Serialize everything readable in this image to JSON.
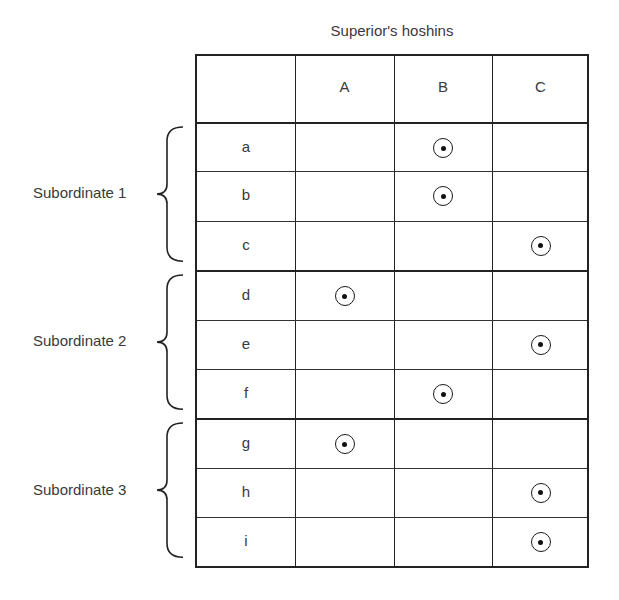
{
  "title": "Superior's hoshins",
  "columns": [
    "A",
    "B",
    "C"
  ],
  "groups": [
    {
      "label": "Subordinate 1",
      "rows": [
        {
          "id": "a",
          "mark": "B"
        },
        {
          "id": "b",
          "mark": "B"
        },
        {
          "id": "c",
          "mark": "C"
        }
      ]
    },
    {
      "label": "Subordinate 2",
      "rows": [
        {
          "id": "d",
          "mark": "A"
        },
        {
          "id": "e",
          "mark": "C"
        },
        {
          "id": "f",
          "mark": "B"
        }
      ]
    },
    {
      "label": "Subordinate 3",
      "rows": [
        {
          "id": "g",
          "mark": "A"
        },
        {
          "id": "h",
          "mark": "C"
        },
        {
          "id": "i",
          "mark": "C"
        }
      ]
    }
  ],
  "legend": {
    "mark_symbol": "circled-dot"
  }
}
